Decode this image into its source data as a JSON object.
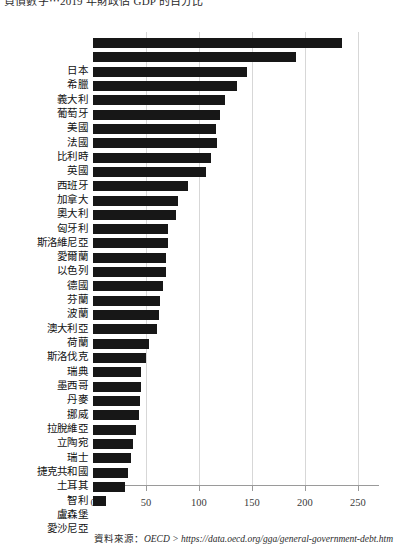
{
  "caption": {
    "text": "負債數字⋯2019 年財政佔 GDP 的百分比"
  },
  "source": {
    "label": "資料來源：",
    "text": "OECD > https://data.oecd.org/gga/general-government-debt.htm"
  },
  "axis": {
    "ticks": [
      "0",
      "50",
      "100",
      "150",
      "200",
      "250"
    ]
  },
  "chart_data": {
    "type": "bar",
    "orientation": "horizontal",
    "title": "負債數字⋯2019 年財政佔 GDP 的百分比",
    "xlabel": "",
    "ylabel": "",
    "xlim": [
      0,
      270
    ],
    "xticks": [
      0,
      50,
      100,
      150,
      200,
      250
    ],
    "grid": true,
    "legend": false,
    "bar_color": "#171717",
    "categories": [
      "日本",
      "希臘",
      "義大利",
      "葡萄牙",
      "美國",
      "法國",
      "比利時",
      "英國",
      "西班牙",
      "加拿大",
      "奧大利",
      "匈牙利",
      "斯洛維尼亞",
      "愛爾蘭",
      "以色列",
      "德國",
      "芬蘭",
      "波蘭",
      "澳大利亞",
      "荷蘭",
      "斯洛伐克",
      "瑞典",
      "墨西哥",
      "丹麥",
      "挪威",
      "拉脫維亞",
      "立陶宛",
      "瑞士",
      "捷克共和國",
      "土耳其",
      "智利",
      "盧森堡",
      "愛沙尼亞"
    ],
    "values": [
      235,
      192,
      145,
      136,
      125,
      120,
      116,
      117,
      111,
      107,
      90,
      80,
      78,
      71,
      71,
      69,
      69,
      66,
      63,
      62,
      60,
      53,
      50,
      45,
      45,
      44,
      43,
      41,
      38,
      36,
      33,
      30,
      12
    ],
    "value_labels": [
      "235",
      "192",
      "145",
      "136",
      "125",
      "120",
      "116",
      "117",
      "111",
      "107",
      "90",
      "80",
      "78",
      "71",
      "71",
      "69",
      "69",
      "66",
      "63",
      "62",
      "60",
      "53",
      "50",
      "45",
      "45",
      "44",
      "43",
      "41",
      "38",
      "36",
      "33",
      "30",
      "12"
    ]
  }
}
